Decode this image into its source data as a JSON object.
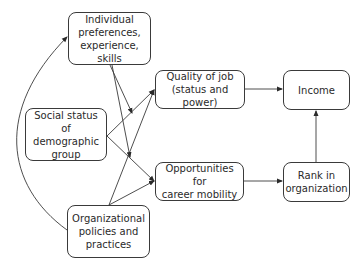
{
  "diagram": {
    "type": "flowchart",
    "nodes": {
      "individual": {
        "label_lines": [
          "Individual",
          "preferences,",
          "experience, skills"
        ]
      },
      "social": {
        "label_lines": [
          "Social status of",
          "demographic",
          "group"
        ]
      },
      "organizational": {
        "label_lines": [
          "Organizational",
          "policies and",
          "practices"
        ]
      },
      "quality": {
        "label_lines": [
          "Quality of job",
          "(status and power)"
        ]
      },
      "opportunities": {
        "label_lines": [
          "Opportunities for",
          "career mobility"
        ]
      },
      "income": {
        "label_lines": [
          "Income"
        ]
      },
      "rank": {
        "label_lines": [
          "Rank in",
          "organization"
        ]
      }
    },
    "edges": [
      {
        "from": "social",
        "to": "quality"
      },
      {
        "from": "social",
        "to": "opportunities"
      },
      {
        "from": "organizational",
        "to": "quality"
      },
      {
        "from": "organizational",
        "to": "opportunities"
      },
      {
        "from": "organizational",
        "to": "individual",
        "style": "curved"
      },
      {
        "from": "individual",
        "to": "edge:social-quality",
        "note": "moderating arrow"
      },
      {
        "from": "individual",
        "to": "edge:social-opportunities",
        "note": "moderating arrow"
      },
      {
        "from": "quality",
        "to": "income"
      },
      {
        "from": "opportunities",
        "to": "rank"
      },
      {
        "from": "rank",
        "to": "income"
      }
    ],
    "colors": {
      "stroke": "#3a3a3a",
      "text": "#2a2a2a",
      "background": "#ffffff"
    }
  }
}
